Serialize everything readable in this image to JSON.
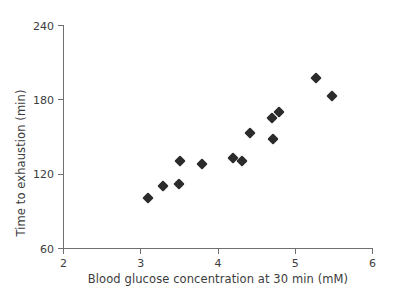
{
  "chart_data": {
    "type": "scatter",
    "title": "",
    "subtitle": "",
    "xlabel": "Blood glucose concentration at 30 min (mM)",
    "ylabel": "Time to exhaustion (min)",
    "xlim": [
      2,
      6
    ],
    "ylim": [
      60,
      240
    ],
    "xticks": [
      2,
      3,
      4,
      5,
      6
    ],
    "yticks": [
      60,
      120,
      180,
      240
    ],
    "xtick_labels": [
      "2",
      "3",
      "4",
      "5",
      "6"
    ],
    "ytick_labels": [
      "60",
      "120",
      "180",
      "240"
    ],
    "grid": false,
    "legend": null,
    "legend_position": "none",
    "marker": "diamond",
    "marker_color": "#2b2b2b",
    "axis_color": "#6f6f6f",
    "background_color": "#ffffff",
    "n_points": 15,
    "series": [
      {
        "name": "Subjects",
        "points": [
          {
            "x": 3.1,
            "y": 100
          },
          {
            "x": 3.3,
            "y": 110
          },
          {
            "x": 3.5,
            "y": 112
          },
          {
            "x": 3.52,
            "y": 130
          },
          {
            "x": 3.8,
            "y": 128
          },
          {
            "x": 4.2,
            "y": 133
          },
          {
            "x": 4.32,
            "y": 130
          },
          {
            "x": 4.42,
            "y": 153
          },
          {
            "x": 4.7,
            "y": 165
          },
          {
            "x": 4.72,
            "y": 148
          },
          {
            "x": 4.8,
            "y": 170
          },
          {
            "x": 5.28,
            "y": 197
          },
          {
            "x": 5.48,
            "y": 183
          }
        ]
      }
    ]
  },
  "axes": {
    "x": {
      "label": "Blood glucose concentration at 30 min (mM)",
      "ticks": [
        {
          "value": 2,
          "label": "2"
        },
        {
          "value": 3,
          "label": "3"
        },
        {
          "value": 4,
          "label": "4"
        },
        {
          "value": 5,
          "label": "5"
        },
        {
          "value": 6,
          "label": "6"
        }
      ]
    },
    "y": {
      "label": "Time to exhaustion (min)",
      "ticks": [
        {
          "value": 240,
          "label": "240"
        },
        {
          "value": 180,
          "label": "180"
        },
        {
          "value": 120,
          "label": "120"
        },
        {
          "value": 60,
          "label": "60"
        }
      ]
    }
  }
}
